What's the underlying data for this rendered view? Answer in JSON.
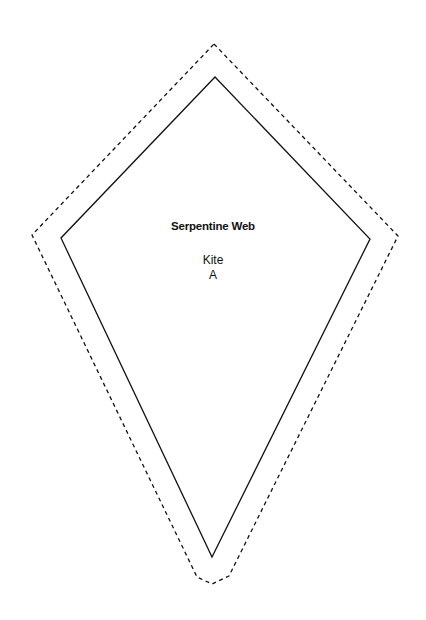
{
  "template": {
    "title": "Serpentine Web",
    "shape_name": "Kite",
    "piece_label": "A"
  },
  "outline": {
    "cut_line_style": "dashed",
    "sew_line_style": "solid",
    "stroke_color": "#111111",
    "sew_line_points": [
      [
        215,
        77
      ],
      [
        370,
        239
      ],
      [
        212,
        557
      ],
      [
        61,
        238
      ]
    ],
    "cut_line_points": [
      [
        214,
        44
      ],
      [
        398,
        236
      ],
      [
        229,
        576
      ],
      [
        212,
        584
      ],
      [
        197,
        577
      ],
      [
        32,
        235
      ]
    ]
  }
}
